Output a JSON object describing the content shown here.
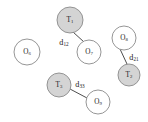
{
  "diagram": {
    "type": "node-distance-diagram",
    "width": 148,
    "height": 122,
    "background_color": "#ffffff",
    "colors": {
      "node_fill_target": "#d4d4d4",
      "node_fill_object": "#ffffff",
      "node_stroke": "#8a8a8a",
      "edge_stroke": "#3a3a3a",
      "label_text": "#1a1a1a"
    },
    "nodes": [
      {
        "id": "o6",
        "base": "O",
        "subscript": "6",
        "label": "O6",
        "kind": "object",
        "fill": "hollow",
        "cx": 27,
        "cy": 52,
        "r": 13
      },
      {
        "id": "t1",
        "base": "T",
        "subscript": "1",
        "label": "T1",
        "kind": "target",
        "fill": "filled",
        "cx": 70,
        "cy": 20,
        "r": 13
      },
      {
        "id": "o7",
        "base": "O",
        "subscript": "7",
        "label": "O7",
        "kind": "object",
        "fill": "hollow",
        "cx": 89,
        "cy": 52,
        "r": 12
      },
      {
        "id": "o8",
        "base": "O",
        "subscript": "8",
        "label": "O8",
        "kind": "object",
        "fill": "hollow",
        "cx": 124,
        "cy": 38,
        "r": 12
      },
      {
        "id": "t2",
        "base": "T",
        "subscript": "2",
        "label": "T2",
        "kind": "target",
        "fill": "filled",
        "cx": 129,
        "cy": 75,
        "r": 11
      },
      {
        "id": "t3",
        "base": "T",
        "subscript": "3",
        "label": "T3",
        "kind": "target",
        "fill": "filled",
        "cx": 59,
        "cy": 85,
        "r": 12
      },
      {
        "id": "o9",
        "base": "O",
        "subscript": "9",
        "label": "O9",
        "kind": "object",
        "fill": "hollow",
        "cx": 98,
        "cy": 102,
        "r": 12
      }
    ],
    "edges": [
      {
        "id": "edge-t1-o7",
        "from": "t1",
        "to": "o7",
        "x1": 73,
        "y1": 32,
        "x2": 84,
        "y2": 42,
        "label_base": "d",
        "label_subscript": "12",
        "label": "d12",
        "label_x": 64,
        "label_y": 43
      },
      {
        "id": "edge-o8-t2",
        "from": "o8",
        "to": "t2",
        "x1": 120,
        "y1": 49,
        "x2": 127,
        "y2": 64,
        "label_base": "d",
        "label_subscript": "21",
        "label": "d21",
        "label_x": 134,
        "label_y": 58
      },
      {
        "id": "edge-t3-o9",
        "from": "t3",
        "to": "o9",
        "x1": 70,
        "y1": 89,
        "x2": 87,
        "y2": 98,
        "label_base": "d",
        "label_subscript": "33",
        "label": "d33",
        "label_x": 80,
        "label_y": 85
      }
    ]
  }
}
